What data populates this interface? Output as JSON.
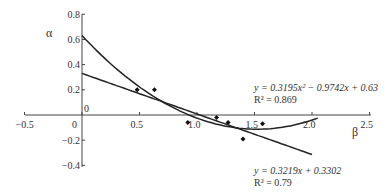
{
  "chart_data": {
    "type": "scatter",
    "title": "",
    "xlabel": "β",
    "ylabel": "α",
    "xlim": [
      -0.5,
      2.5
    ],
    "ylim": [
      -0.4,
      0.8
    ],
    "x_ticks": [
      "-0.5",
      "0",
      "0.5",
      "1.0",
      "1.5",
      "2.0",
      "2.5"
    ],
    "y_ticks": [
      "0.8",
      "0.6",
      "0.4",
      "0.2",
      "0",
      "-0.2",
      "-0.4"
    ],
    "origin_label_top": "0",
    "grid": false,
    "points": [
      {
        "x": 0.48,
        "y": 0.2
      },
      {
        "x": 0.63,
        "y": 0.2
      },
      {
        "x": 0.92,
        "y": -0.06
      },
      {
        "x": 1.17,
        "y": -0.02
      },
      {
        "x": 1.27,
        "y": -0.06
      },
      {
        "x": 1.4,
        "y": -0.19
      },
      {
        "x": 1.57,
        "y": -0.07
      }
    ],
    "series": [
      {
        "name": "quadratic fit",
        "equation": "y = 0.3195x² − 0.9742x + 0.63",
        "r2": "R² = 0.869",
        "coef": [
          0.3195,
          -0.9742,
          0.63
        ],
        "x_range": [
          0,
          2.05
        ]
      },
      {
        "name": "linear fit",
        "equation": "y = 0.3219x + 0.3302",
        "r2": "R² = 0.79",
        "coef": [
          -0.3219,
          0.3302
        ],
        "x_range": [
          0,
          2.0
        ]
      }
    ]
  }
}
